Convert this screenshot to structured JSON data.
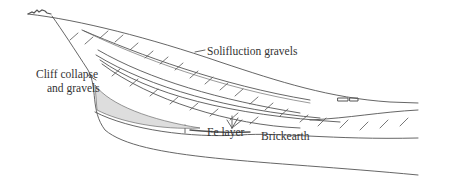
{
  "diagram": {
    "type": "geological-cross-section",
    "labels": {
      "solifluction": "Solifluction gravels",
      "cliff_line1": "Cliff collapse",
      "cliff_line2": "and gravels",
      "fe_layer": "Fe layer",
      "brickearth": "Brickearth"
    },
    "colors": {
      "line": "#444444",
      "background": "#ffffff",
      "text": "#333333"
    }
  }
}
